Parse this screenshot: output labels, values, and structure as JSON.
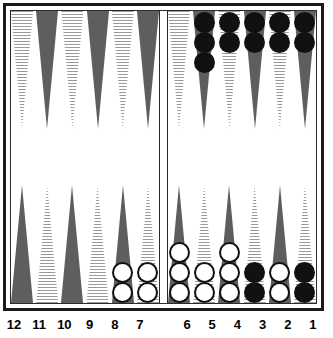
{
  "board": {
    "game": "backgammon",
    "colors": {
      "frame": "#1a1a1a",
      "board_background": "#ffffff",
      "point_dark": "#5e5e5e",
      "point_light_stripe": "#9a9a9a",
      "checker_white": "#ffffff",
      "checker_black": "#111111",
      "checker_outline": "#111111",
      "label_text": "#000000"
    },
    "quadrants": {
      "top_left": {
        "points": [
          {
            "number": "",
            "shade": "light",
            "checkers": 0,
            "checker_color": ""
          },
          {
            "number": "",
            "shade": "dark",
            "checkers": 0,
            "checker_color": ""
          },
          {
            "number": "",
            "shade": "light",
            "checkers": 0,
            "checker_color": ""
          },
          {
            "number": "",
            "shade": "dark",
            "checkers": 0,
            "checker_color": ""
          },
          {
            "number": "",
            "shade": "light",
            "checkers": 0,
            "checker_color": ""
          },
          {
            "number": "",
            "shade": "dark",
            "checkers": 0,
            "checker_color": ""
          }
        ]
      },
      "top_right": {
        "points": [
          {
            "number": "",
            "shade": "light",
            "checkers": 0,
            "checker_color": ""
          },
          {
            "number": "",
            "shade": "dark",
            "checkers": 3,
            "checker_color": "black"
          },
          {
            "number": "",
            "shade": "light",
            "checkers": 2,
            "checker_color": "black"
          },
          {
            "number": "",
            "shade": "dark",
            "checkers": 2,
            "checker_color": "black"
          },
          {
            "number": "",
            "shade": "light",
            "checkers": 2,
            "checker_color": "black"
          },
          {
            "number": "",
            "shade": "dark",
            "checkers": 2,
            "checker_color": "black"
          }
        ]
      },
      "bottom_left": {
        "points": [
          {
            "number": "12",
            "shade": "dark",
            "checkers": 0,
            "checker_color": ""
          },
          {
            "number": "11",
            "shade": "light",
            "checkers": 0,
            "checker_color": ""
          },
          {
            "number": "10",
            "shade": "dark",
            "checkers": 0,
            "checker_color": ""
          },
          {
            "number": "9",
            "shade": "light",
            "checkers": 0,
            "checker_color": ""
          },
          {
            "number": "8",
            "shade": "dark",
            "checkers": 2,
            "checker_color": "white"
          },
          {
            "number": "7",
            "shade": "light",
            "checkers": 2,
            "checker_color": "white"
          }
        ]
      },
      "bottom_right": {
        "points": [
          {
            "number": "6",
            "shade": "dark",
            "checkers": 3,
            "checker_color": "white"
          },
          {
            "number": "5",
            "shade": "light",
            "checkers": 2,
            "checker_color": "white"
          },
          {
            "number": "4",
            "shade": "dark",
            "checkers": 3,
            "checker_color": "white"
          },
          {
            "number": "3",
            "shade": "light",
            "checkers": 2,
            "checker_color": "black"
          },
          {
            "number": "2",
            "shade": "dark",
            "checkers": 2,
            "checker_color": "white"
          },
          {
            "number": "1",
            "shade": "light",
            "checkers": 2,
            "checker_color": "black"
          }
        ]
      }
    },
    "labels": {
      "left": [
        "12",
        "11",
        "10",
        "9",
        "8",
        "7"
      ],
      "right": [
        "6",
        "5",
        "4",
        "3",
        "2",
        "1"
      ]
    }
  }
}
